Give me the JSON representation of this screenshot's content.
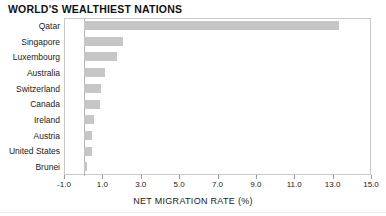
{
  "chart_data": {
    "type": "bar",
    "orientation": "horizontal",
    "title": "WORLD'S WEALTHIEST NATIONS",
    "xlabel": "NET MIGRATION RATE (%)",
    "ylabel": "",
    "xlim": [
      -1.0,
      15.0
    ],
    "xticks": [
      "-1.0",
      "1.0",
      "3.0",
      "5.0",
      "7.0",
      "9.0",
      "11.0",
      "13.0",
      "15.0"
    ],
    "xtick_values": [
      -1.0,
      1.0,
      3.0,
      5.0,
      7.0,
      9.0,
      11.0,
      13.0,
      15.0
    ],
    "grid": false,
    "legend": false,
    "bar_color": "#c6c6c6",
    "axis_color": "#c9c9c9",
    "categories": [
      "Qatar",
      "Singapore",
      "Luxembourg",
      "Australia",
      "Switzerland",
      "Canada",
      "Ireland",
      "Austria",
      "United States",
      "Brunei"
    ],
    "values": [
      13.3,
      2.0,
      1.7,
      1.1,
      0.9,
      0.8,
      0.5,
      0.4,
      0.4,
      0.15
    ]
  }
}
